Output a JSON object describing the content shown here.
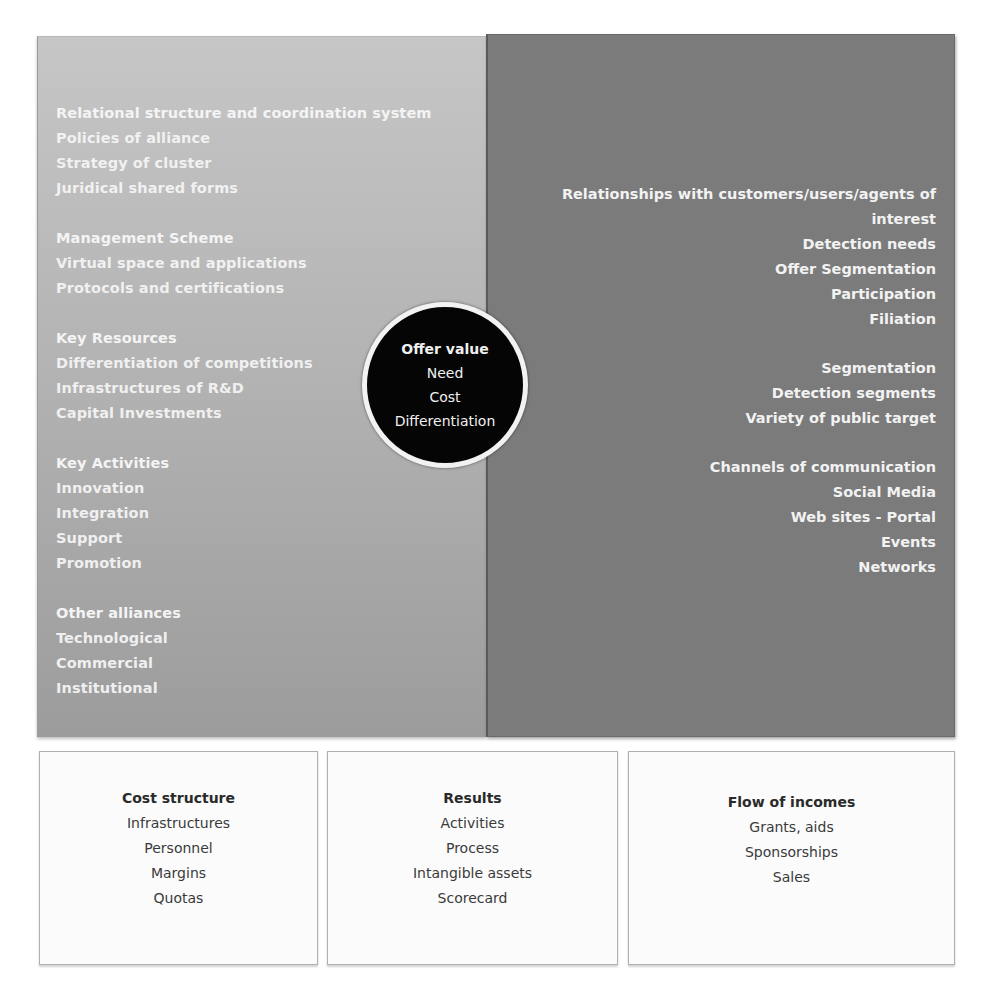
{
  "left_panel": {
    "groups": [
      {
        "head": "Relational structure and coordination system",
        "items": [
          "Policies of alliance",
          "Strategy of cluster",
          "Juridical shared forms"
        ]
      },
      {
        "head": "Management Scheme",
        "items": [
          "Virtual space and applications",
          "Protocols and certifications"
        ]
      },
      {
        "head": "Key Resources",
        "items": [
          "Differentiation of competitions",
          "Infrastructures of R&D",
          "Capital Investments"
        ]
      },
      {
        "head": "Key Activities",
        "items": [
          "Innovation",
          "Integration",
          "Support",
          "Promotion"
        ]
      },
      {
        "head": "Other alliances",
        "items": [
          "Technological",
          "Commercial",
          "Institutional"
        ]
      }
    ]
  },
  "right_panel": {
    "groups": [
      {
        "head_line1": "Relationships with customers/users/agents of",
        "head_line2": "interest",
        "items": [
          "Detection needs",
          "Offer Segmentation",
          "Participation",
          "Filiation"
        ]
      },
      {
        "head": "Segmentation",
        "items": [
          "Detection segments",
          "Variety of public target"
        ]
      },
      {
        "head": "Channels of communication",
        "items": [
          "Social Media",
          "Web sites - Portal",
          "Events",
          "Networks"
        ]
      }
    ]
  },
  "center_circle": {
    "head": "Offer value",
    "items": [
      "Need",
      "Cost",
      "Differentiation"
    ]
  },
  "bottom_boxes": {
    "cost_structure": {
      "head": "Cost structure",
      "items": [
        "Infrastructures",
        "Personnel",
        "Margins",
        "Quotas"
      ]
    },
    "results": {
      "head": "Results",
      "items": [
        "Activities",
        "Process",
        "Intangible assets",
        "Scorecard"
      ]
    },
    "flow_of_incomes": {
      "head": "Flow of incomes",
      "items": [
        "Grants, aids",
        "Sponsorships",
        "Sales"
      ]
    }
  },
  "colors": {
    "left_panel_bg": "#b4b4b4",
    "right_panel_bg": "#7b7b7b",
    "circle_bg": "#050505",
    "circle_border": "#f2f2f2",
    "panel_text": "#f4f4f4",
    "box_text": "#3a3a3a"
  }
}
